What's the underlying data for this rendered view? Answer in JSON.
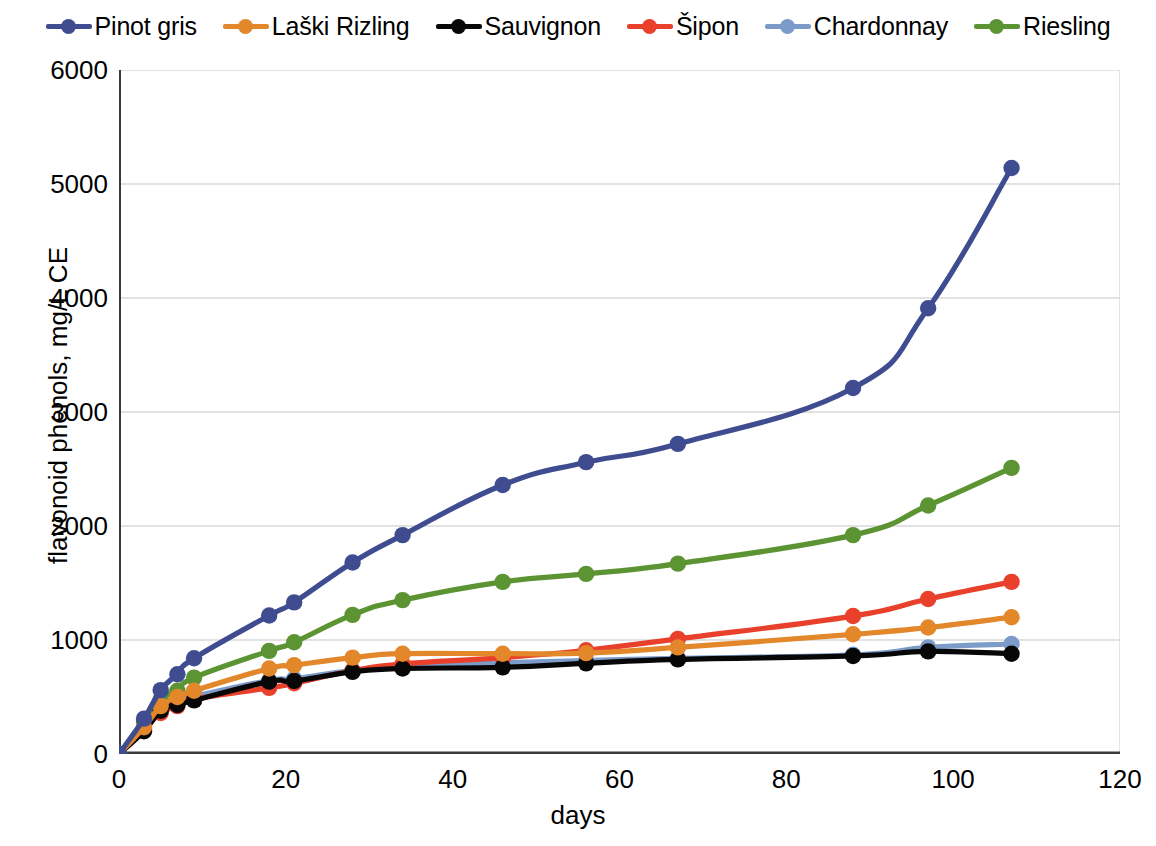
{
  "chart_data": {
    "type": "line",
    "title": "",
    "xlabel": "days",
    "ylabel": "flavonoid phenols, mg/L CE",
    "xlim": [
      0,
      120
    ],
    "ylim": [
      0,
      6000
    ],
    "xticks": [
      0,
      20,
      40,
      60,
      80,
      100,
      120
    ],
    "yticks": [
      0,
      1000,
      2000,
      3000,
      4000,
      5000,
      6000
    ],
    "grid": "horizontal",
    "legend_position": "top",
    "x": [
      0,
      3,
      5,
      7,
      9,
      18,
      21,
      28,
      34,
      46,
      56,
      67,
      88,
      97,
      107
    ],
    "series": [
      {
        "name": "Pinot gris",
        "color": "#3F4C90",
        "values": [
          0,
          310,
          560,
          700,
          840,
          1215,
          1330,
          1680,
          1920,
          2360,
          2560,
          2720,
          3210,
          3910,
          5140
        ]
      },
      {
        "name": "Laški Rizling",
        "color": "#E3872B",
        "values": [
          0,
          235,
          420,
          500,
          555,
          750,
          780,
          845,
          880,
          880,
          885,
          935,
          1050,
          1110,
          1200
        ]
      },
      {
        "name": "Sauvignon",
        "color": "#070707",
        "values": [
          0,
          200,
          380,
          430,
          470,
          635,
          640,
          720,
          750,
          760,
          795,
          830,
          860,
          900,
          880
        ]
      },
      {
        "name": "Šipon",
        "color": "#E8402A",
        "values": [
          0,
          215,
          360,
          420,
          480,
          580,
          620,
          730,
          790,
          845,
          910,
          1010,
          1210,
          1360,
          1510
        ]
      },
      {
        "name": "Chardonnay",
        "color": "#7C9BC8",
        "values": [
          0,
          225,
          420,
          470,
          505,
          645,
          660,
          735,
          775,
          800,
          820,
          840,
          870,
          935,
          965
        ]
      },
      {
        "name": "Riesling",
        "color": "#5C9433",
        "values": [
          0,
          280,
          480,
          555,
          670,
          905,
          980,
          1220,
          1350,
          1510,
          1580,
          1670,
          1920,
          2180,
          2510
        ]
      }
    ]
  },
  "axes": {
    "ylabel": "flavonoid phenols, mg/L CE",
    "xlabel": "days",
    "yticklabels": [
      "6000",
      "5000",
      "4000",
      "3000",
      "2000",
      "1000",
      "0"
    ],
    "xticklabels": [
      "0",
      "20",
      "40",
      "60",
      "80",
      "100",
      "120"
    ]
  },
  "legend": {
    "items": [
      {
        "label": "Pinot gris",
        "color": "#3F4C90"
      },
      {
        "label": "Laški Rizling",
        "color": "#E3872B"
      },
      {
        "label": "Sauvignon",
        "color": "#070707"
      },
      {
        "label": "Šipon",
        "color": "#E8402A"
      },
      {
        "label": "Chardonnay",
        "color": "#7C9BC8"
      },
      {
        "label": "Riesling",
        "color": "#5C9433"
      }
    ]
  },
  "style": {
    "grid_color": "#D9D9D9",
    "axis_color": "#3A3A3A",
    "background": "#FFFFFF"
  }
}
